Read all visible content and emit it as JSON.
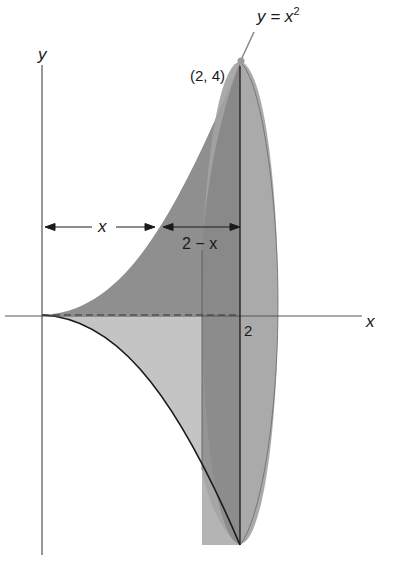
{
  "figure": {
    "curve_label": "y = x",
    "curve_label_exp": "2",
    "point_label": "(2, 4)",
    "y_axis_label": "y",
    "x_axis_label": "x",
    "tick_label_2": "2",
    "dim_x_label": "x",
    "dim_2mx_label": "2 − x"
  },
  "colors": {
    "upper_region": "#8f8f8f",
    "lower_region": "#c4c4c4",
    "ellipse": "#a6a6a6",
    "shell_band": "#7a7a7a",
    "lines": "#1a1a1a"
  }
}
